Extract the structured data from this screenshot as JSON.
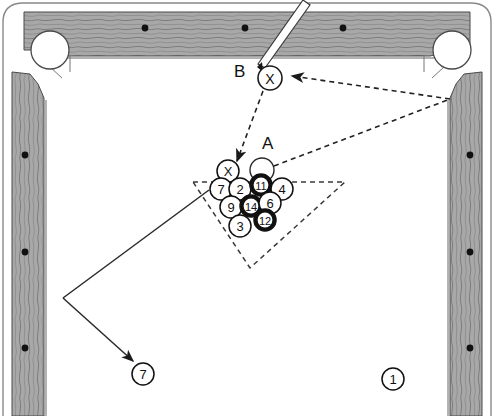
{
  "diagram": {
    "surface_color": "#ffffff",
    "rail_color": "#9a9a9a",
    "line_color": "#1a1a1a",
    "ball_fill_light": "#ffffff",
    "ball_fill_dark": "#111111"
  },
  "labels": {
    "point_a": "A",
    "point_b": "B"
  },
  "cue_ball_b": {
    "mark": "X"
  },
  "object_ball_a": {
    "mark": ""
  },
  "rack": {
    "shape": "inverted-triangle",
    "balls": [
      {
        "label": "X",
        "cx": 228,
        "cy": 171,
        "r": 11,
        "dark": false
      },
      {
        "label": "7",
        "cx": 221,
        "cy": 189,
        "r": 11,
        "dark": false
      },
      {
        "label": "2",
        "cx": 240,
        "cy": 189,
        "r": 11,
        "dark": false
      },
      {
        "label": "11",
        "cx": 261,
        "cy": 185,
        "r": 11,
        "dark": true
      },
      {
        "label": "4",
        "cx": 282,
        "cy": 189,
        "r": 11,
        "dark": false
      },
      {
        "label": "9",
        "cx": 231,
        "cy": 207,
        "r": 11,
        "dark": false
      },
      {
        "label": "14",
        "cx": 251,
        "cy": 206,
        "r": 11,
        "dark": true
      },
      {
        "label": "6",
        "cx": 270,
        "cy": 203,
        "r": 11,
        "dark": false
      },
      {
        "label": "12",
        "cx": 265,
        "cy": 220,
        "r": 11,
        "dark": true
      },
      {
        "label": "3",
        "cx": 240,
        "cy": 226,
        "r": 11,
        "dark": false
      }
    ]
  },
  "loose_balls": [
    {
      "label": "7",
      "cx": 143,
      "cy": 374,
      "r": 11,
      "dark": false
    },
    {
      "label": "1",
      "cx": 393,
      "cy": 379,
      "r": 11,
      "dark": false
    }
  ],
  "rails": {
    "top_diamonds": [
      {
        "cx": 145,
        "cy": 28
      },
      {
        "cx": 245,
        "cy": 28
      },
      {
        "cx": 343,
        "cy": 28
      }
    ],
    "left_diamonds": [
      {
        "cx": 25,
        "cy": 155
      },
      {
        "cx": 25,
        "cy": 252
      },
      {
        "cx": 25,
        "cy": 348
      }
    ],
    "right_diamonds": [
      {
        "cx": 470,
        "cy": 155
      },
      {
        "cx": 470,
        "cy": 252
      },
      {
        "cx": 470,
        "cy": 348
      }
    ]
  },
  "pockets": [
    {
      "name": "top-left-pocket",
      "cx": 50,
      "cy": 50,
      "r": 19
    },
    {
      "name": "top-right-pocket",
      "cx": 452,
      "cy": 50,
      "r": 19
    }
  ],
  "cue_stick": {
    "tip_x": 258,
    "tip_y": 66,
    "butt_x": 304,
    "butt_y": 2
  },
  "paths": {
    "dashed_b_to_rack": "M 262,90 L 236,163",
    "dashed_rail_to_b": "M 450,99 L 290,76",
    "dashed_a_to_rail": "M 272,166 L 450,99",
    "solid_rack_to_rail": "M 209,190 L 63,298",
    "solid_rail_to_seven": "M 63,298 L 134,362"
  }
}
